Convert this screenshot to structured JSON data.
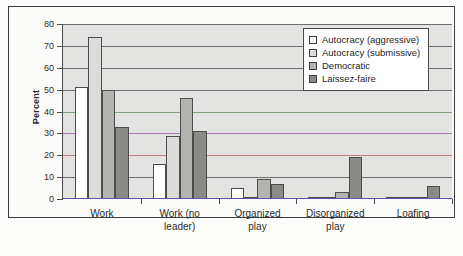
{
  "chart_data": {
    "type": "bar",
    "title": "",
    "xlabel": "",
    "ylabel": "Percent",
    "ylim": [
      0,
      80
    ],
    "yticks": [
      0,
      10,
      20,
      30,
      40,
      50,
      60,
      70,
      80
    ],
    "ytick_labels": [
      "0",
      "10",
      "20",
      "30",
      "40",
      "50",
      "60",
      "70",
      "80"
    ],
    "grid": true,
    "legend_position": "top-right",
    "categories": [
      "Work",
      "Work (no\nleader)",
      "Organized\nplay",
      "Disorganized\nplay",
      "Loafing"
    ],
    "series": [
      {
        "name": "Autocracy (aggressive)",
        "color": "#ffffff",
        "values": [
          51,
          16,
          5,
          0,
          0
        ]
      },
      {
        "name": "Autocracy (submissive)",
        "color": "#dcdcda",
        "values": [
          74,
          29,
          1,
          0,
          1
        ]
      },
      {
        "name": "Democratic",
        "color": "#b3b3b0",
        "values": [
          50,
          46,
          9,
          3,
          0
        ]
      },
      {
        "name": "Laissez-faire",
        "color": "#8a8a87",
        "values": [
          33,
          31,
          7,
          19,
          6
        ]
      }
    ]
  },
  "legend": {
    "items": [
      {
        "label": "Autocracy (aggressive)",
        "swatch": "#ffffff"
      },
      {
        "label": "Autocracy (submissive)",
        "swatch": "#dcdcda"
      },
      {
        "label": "Democratic",
        "swatch": "#b3b3b0"
      },
      {
        "label": "Laissez-faire",
        "swatch": "#8a8a87"
      }
    ]
  },
  "axis": {
    "y_title": "Percent"
  }
}
